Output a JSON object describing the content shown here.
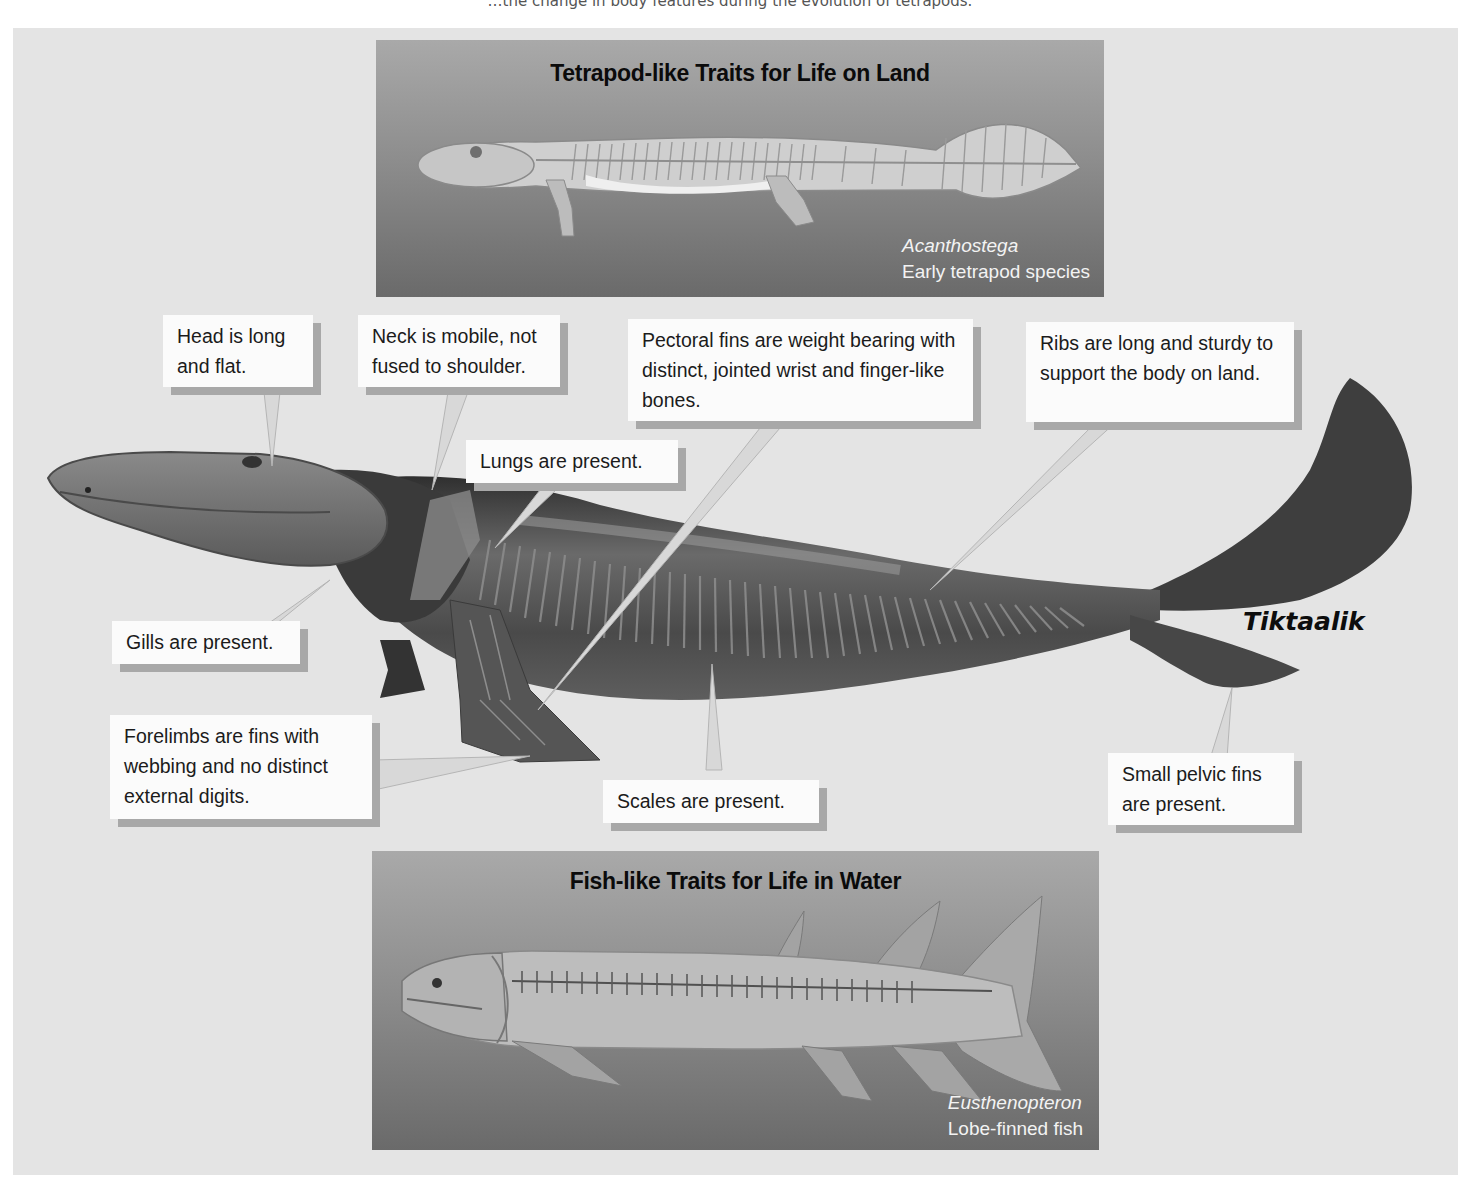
{
  "caption_fragment": "…the change in body features during the evolution of tetrapods.",
  "top_panel": {
    "title": "Tetrapod-like Traits for Life on Land",
    "species_name": "Acanthostega",
    "species_description": "Early tetrapod species"
  },
  "main_specimen": {
    "name": "Tiktaalik"
  },
  "callouts": {
    "head": "Head is long and flat.",
    "neck": "Neck is mobile, not fused to shoulder.",
    "pectoral": "Pectoral fins are weight bearing with distinct, jointed wrist and finger-like bones.",
    "ribs": "Ribs are long and sturdy to support the body on land.",
    "lungs": "Lungs are present.",
    "gills": "Gills are present.",
    "forelimbs": "Forelimbs are fins with webbing and no distinct external digits.",
    "scales": "Scales are present.",
    "pelvic": "Small pelvic fins are present."
  },
  "bottom_panel": {
    "title": "Fish-like Traits for Life in Water",
    "species_name": "Eusthenopteron",
    "species_description": "Lobe-finned fish"
  },
  "colors": {
    "background": "#e4e4e4",
    "callout_fill": "#fbfbfb",
    "callout_shadow": "#a8a8a8",
    "panel_top": "#a9a9a9",
    "panel_bottom": "#6a6a6a",
    "creature_dark": "#3e3e3e"
  }
}
